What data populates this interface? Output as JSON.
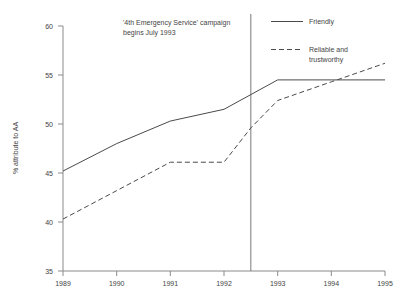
{
  "chart_data": {
    "type": "line",
    "title": "",
    "xlabel": "",
    "ylabel": "% attribute to AA",
    "xlim": [
      1989,
      1995
    ],
    "ylim": [
      35,
      60
    ],
    "grid": false,
    "legend_position": "top-right",
    "x_ticks": [
      "1989",
      "1990",
      "1991",
      "1992",
      "1993",
      "1994",
      "1995"
    ],
    "y_ticks": [
      "35",
      "40",
      "45",
      "50",
      "55",
      "60"
    ],
    "x": [
      1989,
      1990,
      1991,
      1992,
      1992.5,
      1993,
      1994,
      1995
    ],
    "series": [
      {
        "name": "Friendly",
        "style": "solid",
        "values": [
          45.2,
          48.0,
          50.3,
          51.5,
          53.0,
          54.5,
          54.5,
          54.5
        ]
      },
      {
        "name": "Reliable and trustworthy",
        "style": "dashed",
        "values": [
          40.3,
          43.2,
          46.1,
          46.1,
          49.6,
          52.4,
          54.3,
          56.2
        ]
      }
    ],
    "annotations": [
      {
        "name": "campaign-marker",
        "x": 1992.5,
        "line1": "'4th Emergency Service' campaign",
        "line2": "begins July 1993"
      }
    ]
  },
  "legend": {
    "items": [
      {
        "label": "Friendly",
        "style": "solid"
      },
      {
        "label_line1": "Reliable and",
        "label_line2": "trustworthy",
        "style": "dashed"
      }
    ]
  },
  "colors": {
    "series": "#4a4a4a",
    "axis": "#8a8a8a",
    "text": "#444444",
    "background": "#ffffff"
  }
}
